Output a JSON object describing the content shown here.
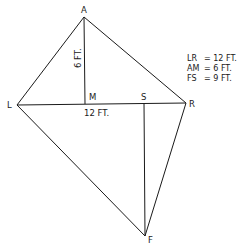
{
  "diagram": {
    "points": {
      "A": {
        "label": "A",
        "x": 84,
        "y": 17
      },
      "L": {
        "label": "L",
        "x": 17,
        "y": 105
      },
      "R": {
        "label": "R",
        "x": 186,
        "y": 103
      },
      "M": {
        "label": "M",
        "x": 85,
        "y": 104
      },
      "S": {
        "label": "S",
        "x": 144,
        "y": 103
      },
      "F": {
        "label": "F",
        "x": 145,
        "y": 236
      }
    },
    "segments": [
      [
        "A",
        "L"
      ],
      [
        "A",
        "R"
      ],
      [
        "L",
        "R"
      ],
      [
        "A",
        "M"
      ],
      [
        "L",
        "F"
      ],
      [
        "R",
        "F"
      ],
      [
        "S",
        "F"
      ]
    ],
    "dimension_labels": {
      "am": "6 FT.",
      "lr": "12 FT."
    },
    "legend": [
      {
        "key": "LR",
        "value": "= 12 FT."
      },
      {
        "key": "AM",
        "value": "= 6 FT."
      },
      {
        "key": "FS",
        "value": "= 9 FT."
      }
    ]
  }
}
